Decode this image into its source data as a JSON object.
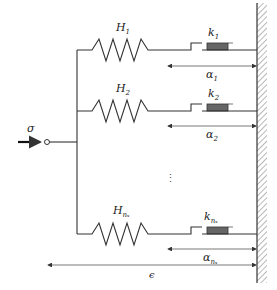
{
  "diagram": {
    "type": "rheological-model",
    "input": {
      "label": "σ"
    },
    "branches": [
      {
        "spring": {
          "label": "H",
          "sub": "1"
        },
        "friction": {
          "label": "k",
          "sub": "1"
        },
        "displacement": {
          "label": "α",
          "sub": "1"
        }
      },
      {
        "spring": {
          "label": "H",
          "sub": "2"
        },
        "friction": {
          "label": "k",
          "sub": "2"
        },
        "displacement": {
          "label": "α",
          "sub": "2"
        }
      },
      {
        "spring": {
          "label": "H",
          "sub": "nₛ"
        },
        "friction": {
          "label": "k",
          "sub": "nₛ"
        },
        "displacement": {
          "label": "α",
          "sub": "nₛ"
        }
      }
    ],
    "ellipsis": "⋮",
    "total_strain": {
      "label": "ϵ"
    },
    "colors": {
      "line": "#333333",
      "friction_block": "#666666",
      "wall_hatch": "#888888"
    }
  }
}
